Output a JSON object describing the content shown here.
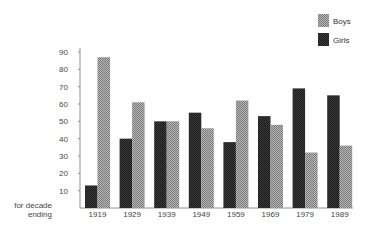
{
  "chart_data": {
    "type": "bar",
    "title": "",
    "xlabel": "for decade ending",
    "xlabel_lines": [
      "for decade",
      "ending"
    ],
    "ylabel": "",
    "ylim": [
      0,
      90
    ],
    "yticks": [
      10,
      20,
      30,
      40,
      50,
      60,
      70,
      80,
      90
    ],
    "grid": false,
    "legend_position": "top-right",
    "categories": [
      "1919",
      "1929",
      "1939",
      "1949",
      "1959",
      "1969",
      "1979",
      "1989"
    ],
    "series": [
      {
        "name": "Girls",
        "color": "#2b2b2b",
        "pattern": "dark-crosshatch",
        "values": [
          13,
          40,
          50,
          55,
          38,
          53,
          69,
          65
        ]
      },
      {
        "name": "Boys",
        "color": "#9a9a9a",
        "pattern": "light-crosshatch",
        "values": [
          87,
          61,
          50,
          46,
          62,
          48,
          32,
          36
        ]
      }
    ],
    "legend": [
      "Boys",
      "Girls"
    ]
  }
}
